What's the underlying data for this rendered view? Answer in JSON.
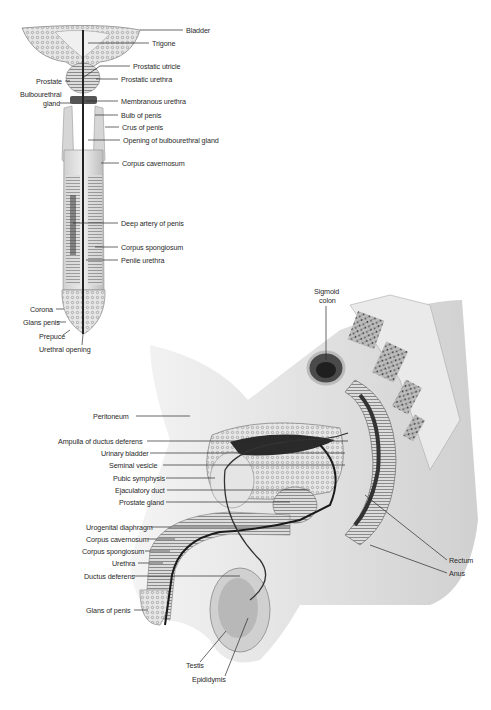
{
  "figure": {
    "type": "anatomical-illustration",
    "views": [
      "coronal section of penis and urethra",
      "sagittal section of male pelvis"
    ]
  },
  "top_view": {
    "labels_right": [
      {
        "text": "Bladder",
        "x": 186,
        "y": 27
      },
      {
        "text": "Trigone",
        "x": 152,
        "y": 40
      },
      {
        "text": "Prostatic utricle",
        "x": 133,
        "y": 63
      },
      {
        "text": "Prostatic urethra",
        "x": 121,
        "y": 76
      },
      {
        "text": "Membranous urethra",
        "x": 121,
        "y": 98
      },
      {
        "text": "Bulb of penis",
        "x": 121,
        "y": 112
      },
      {
        "text": "Crus of penis",
        "x": 122,
        "y": 124
      },
      {
        "text": "Opening of bulbourethral gland",
        "x": 123,
        "y": 137
      },
      {
        "text": "Corpus cavernosum",
        "x": 122,
        "y": 160
      },
      {
        "text": "Deep artery of penis",
        "x": 121,
        "y": 220
      },
      {
        "text": "Corpus spongiosum",
        "x": 121,
        "y": 244
      },
      {
        "text": "Penile urethra",
        "x": 121,
        "y": 257
      }
    ],
    "labels_left": [
      {
        "text": "Prostate",
        "x": 36,
        "y": 78
      },
      {
        "text": "Bulbourethral",
        "x": 20,
        "y": 91
      },
      {
        "text": "gland",
        "x": 43,
        "y": 100
      },
      {
        "text": "Corona",
        "x": 30,
        "y": 306
      },
      {
        "text": "Glans penis",
        "x": 23,
        "y": 319
      },
      {
        "text": "Prepuce",
        "x": 39,
        "y": 333
      },
      {
        "text": "Urethral opening",
        "x": 39,
        "y": 346
      }
    ]
  },
  "sagittal_view": {
    "labels_top": [
      {
        "text": "Sigmoid",
        "x": 316,
        "y": 288
      },
      {
        "text": "colon",
        "x": 320,
        "y": 297
      }
    ],
    "labels_left": [
      {
        "text": "Peritoneum",
        "x": 93,
        "y": 413
      },
      {
        "text": "Ampulla of ductus deferens",
        "x": 58,
        "y": 438
      },
      {
        "text": "Urinary bladder",
        "x": 101,
        "y": 450
      },
      {
        "text": "Seminal vesicle",
        "x": 109,
        "y": 462
      },
      {
        "text": "Pubic symphysis",
        "x": 113,
        "y": 475
      },
      {
        "text": "Ejaculatory duct",
        "x": 115,
        "y": 487
      },
      {
        "text": "Prostate gland",
        "x": 119,
        "y": 499
      },
      {
        "text": "Urogenital diaphragm",
        "x": 86,
        "y": 524
      },
      {
        "text": "Corpus cavernosum",
        "x": 86,
        "y": 536
      },
      {
        "text": "Corpus spongiosum",
        "x": 82,
        "y": 548
      },
      {
        "text": "Urethra",
        "x": 112,
        "y": 560
      },
      {
        "text": "Ductus deferens",
        "x": 84,
        "y": 573
      },
      {
        "text": "Glans of penis",
        "x": 86,
        "y": 607
      }
    ],
    "labels_right": [
      {
        "text": "Rectum",
        "x": 449,
        "y": 557
      },
      {
        "text": "Anus",
        "x": 449,
        "y": 570
      }
    ],
    "labels_bottom": [
      {
        "text": "Testis",
        "x": 196,
        "y": 662
      },
      {
        "text": "Epididymis",
        "x": 194,
        "y": 676
      }
    ]
  },
  "colors": {
    "background": "#ffffff",
    "leader_line": "#2a2a2a",
    "tissue_light": "#e2e2e2",
    "tissue_mid": "#b9b9b9",
    "tissue_dark": "#6e6e6e",
    "urethra_line": "#1a1a1a"
  }
}
